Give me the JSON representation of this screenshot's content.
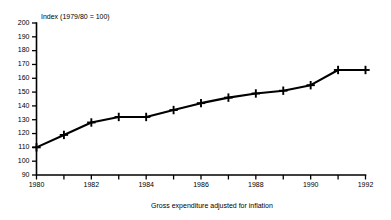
{
  "chart_data": {
    "type": "line",
    "title": "Index (1979/80 = 100)",
    "subtitle": "",
    "xlabel": "Gross expenditure adjusted for inflation",
    "ylabel": "",
    "x": [
      1980,
      1981,
      1982,
      1983,
      1984,
      1985,
      1986,
      1987,
      1988,
      1989,
      1990,
      1991,
      1992
    ],
    "values": [
      110,
      119,
      128,
      132,
      132,
      137,
      142,
      146,
      149,
      151,
      155,
      166,
      166
    ],
    "series": [
      {
        "name": "Gross expenditure adjusted for inflation",
        "values": [
          110,
          119,
          128,
          132,
          132,
          137,
          142,
          146,
          149,
          151,
          155,
          166,
          166
        ]
      }
    ],
    "xlim": [
      1980,
      1992
    ],
    "ylim": [
      90,
      200
    ],
    "ytick_values": [
      90,
      100,
      110,
      120,
      130,
      140,
      150,
      160,
      170,
      180,
      190,
      200
    ],
    "ytick_labels": [
      "90",
      "100",
      "110",
      "120",
      "130",
      "140",
      "150",
      "160",
      "170",
      "180",
      "190",
      "200"
    ],
    "xtick_values": [
      1980,
      1981,
      1982,
      1983,
      1984,
      1985,
      1986,
      1987,
      1988,
      1989,
      1990,
      1991,
      1992
    ],
    "xtick_labels_shown": [
      "1980",
      "",
      "1982",
      "",
      "1984",
      "",
      "1986",
      "",
      "1988",
      "",
      "1990",
      "",
      "1992"
    ],
    "grid": false,
    "legend": false,
    "legend_position": "none",
    "marker_style": "plus",
    "line_color": "#000000",
    "background_color": "#FFFFFF"
  },
  "axes": {
    "y_axis_title": "Index (1979/80 = 100)",
    "x_axis_caption": "Gross expenditure adjusted for inflation"
  }
}
